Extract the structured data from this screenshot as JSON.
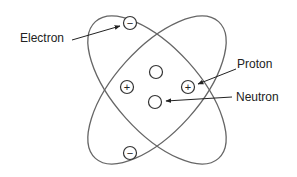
{
  "diagram": {
    "labels": {
      "electron": "Electron",
      "proton": "Proton",
      "neutron": "Neutron"
    },
    "symbols": {
      "electron": "−",
      "proton": "+"
    },
    "colors": {
      "stroke": "#555555",
      "text": "#222222",
      "background": "#ffffff"
    }
  }
}
